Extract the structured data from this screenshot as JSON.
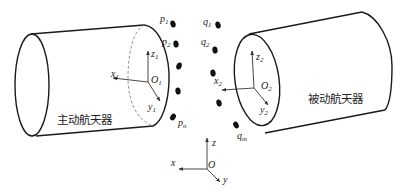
{
  "diagram": {
    "active_spacecraft": {
      "label": "主动航天器",
      "frame": {
        "origin": "O",
        "origin_sub": "1",
        "x": "x",
        "x_sub": "1",
        "y": "y",
        "y_sub": "1",
        "z": "z",
        "z_sub": "1"
      }
    },
    "passive_spacecraft": {
      "label": "被动航天器",
      "frame": {
        "origin": "O",
        "origin_sub": "2",
        "x": "x",
        "x_sub": "2",
        "y": "y",
        "y_sub": "2",
        "z": "z",
        "z_sub": "2"
      }
    },
    "active_points": {
      "labels": [
        {
          "base": "p",
          "sub": "1"
        },
        {
          "base": "p",
          "sub": "2"
        },
        {
          "base": "p",
          "sub": "n"
        }
      ],
      "count_shown": 5
    },
    "passive_points": {
      "labels": [
        {
          "base": "q",
          "sub": "1"
        },
        {
          "base": "q",
          "sub": "2"
        },
        {
          "base": "q",
          "sub": "m"
        }
      ],
      "count_shown": 5
    },
    "world_frame": {
      "origin": "O",
      "x": "x",
      "y": "y",
      "z": "z"
    }
  },
  "colors": {
    "stroke": "#1a1a1a",
    "background": "#ffffff"
  }
}
